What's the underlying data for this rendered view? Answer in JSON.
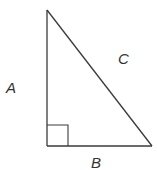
{
  "diagram": {
    "type": "right-triangle",
    "stroke_color": "#3a3a3a",
    "vertices": {
      "top": [
        47,
        10
      ],
      "right_angle": [
        47,
        146
      ],
      "bottom_right": [
        152,
        146
      ]
    },
    "right_angle_marker": {
      "x": 47,
      "y": 125,
      "size": 21
    },
    "labels": {
      "A": {
        "text": "A",
        "side": "vertical leg",
        "x": 6,
        "y": 93
      },
      "B": {
        "text": "B",
        "side": "horizontal leg",
        "x": 91,
        "y": 168
      },
      "C": {
        "text": "C",
        "side": "hypotenuse",
        "x": 118,
        "y": 64
      }
    }
  }
}
